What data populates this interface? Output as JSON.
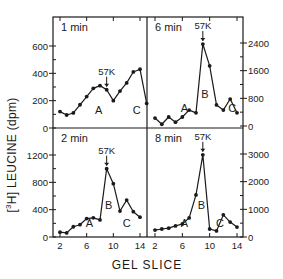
{
  "figure": {
    "ylabel": "[³H] LEUCINE (dpm)",
    "ylabel_prefix": "[",
    "ylabel_sup": "3",
    "ylabel_main": "H] LEUCINE (dpm)",
    "xlabel": "GEL SLICE",
    "line_color": "#1a1a1a",
    "background": "#ffffff"
  },
  "chart_data": [
    {
      "type": "line",
      "title": "1 min",
      "panel": "top-left",
      "x": [
        2,
        3,
        4,
        5,
        6,
        7,
        8,
        9,
        10,
        11,
        12,
        13,
        14,
        15
      ],
      "values": [
        120,
        95,
        110,
        170,
        230,
        290,
        310,
        280,
        200,
        270,
        330,
        410,
        430,
        180
      ],
      "xlabel": "GEL SLICE",
      "ylabel": "[3H] LEUCINE (dpm)",
      "ylim": [
        0,
        700
      ],
      "yticks": [
        0,
        200,
        400,
        600
      ],
      "ytick_side": "left",
      "annotations": [
        {
          "text": "57K",
          "x": 9,
          "type": "arrow-down"
        },
        {
          "text": "A",
          "x": 7.8
        },
        {
          "text": "C",
          "x": 13.5
        }
      ]
    },
    {
      "type": "line",
      "title": "6 min",
      "panel": "top-right",
      "x": [
        2,
        3,
        4,
        5,
        6,
        7,
        8,
        9,
        10,
        11,
        12,
        13,
        14
      ],
      "values": [
        230,
        50,
        260,
        110,
        260,
        460,
        380,
        2370,
        1740,
        610,
        460,
        780,
        380
      ],
      "xlabel": "GEL SLICE",
      "ylabel": "[3H] LEUCINE (dpm)",
      "ylim": [
        0,
        2800
      ],
      "yticks": [
        0,
        800,
        1600,
        2400
      ],
      "ytick_side": "right",
      "annotations": [
        {
          "text": "57K",
          "x": 9,
          "type": "arrow-down"
        },
        {
          "text": "A",
          "x": 6.3
        },
        {
          "text": "B",
          "x": 9.3
        },
        {
          "text": "C",
          "x": 13.3
        }
      ]
    },
    {
      "type": "line",
      "title": "2 min",
      "panel": "bottom-left",
      "x": [
        2,
        3,
        4,
        5,
        6,
        7,
        8,
        9,
        10,
        11,
        12,
        13,
        14
      ],
      "values": [
        70,
        60,
        150,
        180,
        270,
        280,
        250,
        1000,
        780,
        380,
        540,
        370,
        290
      ],
      "xlabel": "GEL SLICE",
      "ylabel": "[3H] LEUCINE (dpm)",
      "ylim": [
        0,
        1400
      ],
      "yticks": [
        0,
        400,
        800,
        1200
      ],
      "xticks": [
        2,
        6,
        10,
        14
      ],
      "ytick_side": "left",
      "annotations": [
        {
          "text": "57K",
          "x": 9,
          "type": "arrow-down"
        },
        {
          "text": "A",
          "x": 6.4
        },
        {
          "text": "B",
          "x": 9.3
        },
        {
          "text": "C",
          "x": 12
        }
      ]
    },
    {
      "type": "line",
      "title": "8 min",
      "panel": "bottom-right",
      "x": [
        2,
        3,
        4,
        5,
        6,
        7,
        8,
        9,
        10,
        11,
        12,
        13,
        14
      ],
      "values": [
        250,
        290,
        320,
        400,
        470,
        690,
        1520,
        2970,
        290,
        220,
        800,
        540,
        360
      ],
      "xlabel": "GEL SLICE",
      "ylabel": "[3H] LEUCINE (dpm)",
      "ylim": [
        0,
        3500
      ],
      "yticks": [
        0,
        1000,
        2000,
        3000
      ],
      "xticks": [
        2,
        6,
        10,
        14
      ],
      "ytick_side": "right",
      "annotations": [
        {
          "text": "57K",
          "x": 9,
          "type": "arrow-down"
        },
        {
          "text": "A",
          "x": 6.3
        },
        {
          "text": "B",
          "x": 8.8
        },
        {
          "text": "C",
          "x": 11.5
        }
      ]
    }
  ]
}
